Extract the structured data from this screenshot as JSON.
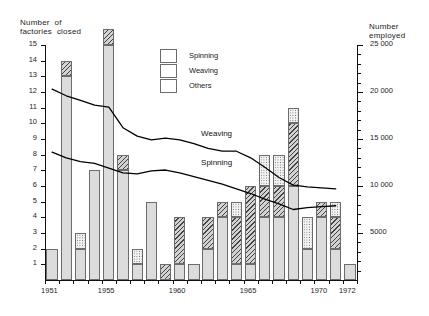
{
  "chart_data": {
    "type": "bar",
    "title": "",
    "ylabel": "Number of\nfactories closed",
    "ylabel_right": "Number\nemployed",
    "xlabel": "",
    "ylim": [
      0,
      15
    ],
    "ylim_right": [
      0,
      25000
    ],
    "grid": false,
    "legend_position": "top-center",
    "x": [
      1951,
      1952,
      1953,
      1954,
      1955,
      1956,
      1957,
      1958,
      1959,
      1960,
      1961,
      1962,
      1963,
      1964,
      1965,
      1966,
      1967,
      1968,
      1969,
      1970,
      1971,
      1972
    ],
    "x_tick_labels": [
      "1951",
      "1955",
      "1960",
      "1965",
      "1970",
      "1972"
    ],
    "x_tick_years": [
      1951,
      1955,
      1960,
      1965,
      1970,
      1972
    ],
    "y_tick_labels": [
      "1",
      "2",
      "3",
      "4",
      "5",
      "6",
      "7",
      "8",
      "9",
      "10",
      "11",
      "12",
      "13",
      "14",
      "15"
    ],
    "y_tick_values": [
      1,
      2,
      3,
      4,
      5,
      6,
      7,
      8,
      9,
      10,
      11,
      12,
      13,
      14,
      15
    ],
    "y_right_tick_labels": [
      "5000",
      "10 000",
      "15 000",
      "20 000",
      "25 000"
    ],
    "y_right_tick_values": [
      5000,
      10000,
      15000,
      20000,
      25000
    ],
    "legend": [
      {
        "key": "spinning",
        "label": "Spinning",
        "pattern": "solid-light-gray"
      },
      {
        "key": "weaving",
        "label": "Weaving",
        "pattern": "diagonal-hatch"
      },
      {
        "key": "others",
        "label": "Others",
        "pattern": "stipple-dots"
      }
    ],
    "series": [
      {
        "name": "Spinning",
        "key": "spinning",
        "values": [
          2,
          13,
          2,
          7,
          15,
          7,
          1,
          5,
          0,
          1,
          1,
          2,
          4,
          1,
          1,
          4,
          4,
          6,
          2,
          4,
          2,
          1
        ]
      },
      {
        "name": "Weaving",
        "key": "weaving",
        "values": [
          0,
          1,
          0,
          0,
          1,
          1,
          0,
          0,
          1,
          3,
          0,
          2,
          1,
          3,
          5,
          2,
          2,
          4,
          0,
          1,
          2,
          0
        ]
      },
      {
        "name": "Others",
        "key": "others",
        "values": [
          0,
          0,
          1,
          0,
          0,
          0,
          1,
          0,
          0,
          0,
          0,
          0,
          0,
          1,
          0,
          2,
          2,
          1,
          2,
          0,
          1,
          0
        ]
      }
    ],
    "bar_totals": [
      2,
      14,
      3,
      7,
      16,
      8,
      2,
      5,
      1,
      4,
      1,
      4,
      5,
      5,
      6,
      8,
      8,
      11,
      4,
      5,
      5,
      1
    ],
    "line_series": [
      {
        "name": "Weaving",
        "label": "Weaving",
        "axis": "right",
        "unit": "employed",
        "points": [
          {
            "x": 1951,
            "y": 20300
          },
          {
            "x": 1952,
            "y": 19600
          },
          {
            "x": 1953,
            "y": 19100
          },
          {
            "x": 1954,
            "y": 18600
          },
          {
            "x": 1955,
            "y": 18400
          },
          {
            "x": 1956,
            "y": 16200
          },
          {
            "x": 1957,
            "y": 15300
          },
          {
            "x": 1958,
            "y": 14900
          },
          {
            "x": 1959,
            "y": 15100
          },
          {
            "x": 1960,
            "y": 14900
          },
          {
            "x": 1961,
            "y": 14500
          },
          {
            "x": 1962,
            "y": 14000
          },
          {
            "x": 1963,
            "y": 13700
          },
          {
            "x": 1964,
            "y": 13700
          },
          {
            "x": 1965,
            "y": 13000
          },
          {
            "x": 1966,
            "y": 12000
          },
          {
            "x": 1967,
            "y": 10900
          },
          {
            "x": 1968,
            "y": 10100
          },
          {
            "x": 1969,
            "y": 9900
          },
          {
            "x": 1970,
            "y": 9800
          },
          {
            "x": 1971,
            "y": 9700
          }
        ]
      },
      {
        "name": "Spinning",
        "label": "Spinning",
        "axis": "right",
        "unit": "employed",
        "points": [
          {
            "x": 1951,
            "y": 13600
          },
          {
            "x": 1952,
            "y": 13000
          },
          {
            "x": 1953,
            "y": 12600
          },
          {
            "x": 1954,
            "y": 12400
          },
          {
            "x": 1955,
            "y": 11900
          },
          {
            "x": 1956,
            "y": 11400
          },
          {
            "x": 1957,
            "y": 11300
          },
          {
            "x": 1958,
            "y": 11600
          },
          {
            "x": 1959,
            "y": 11700
          },
          {
            "x": 1960,
            "y": 11400
          },
          {
            "x": 1961,
            "y": 11000
          },
          {
            "x": 1962,
            "y": 10600
          },
          {
            "x": 1963,
            "y": 10200
          },
          {
            "x": 1964,
            "y": 9700
          },
          {
            "x": 1965,
            "y": 9200
          },
          {
            "x": 1966,
            "y": 8600
          },
          {
            "x": 1967,
            "y": 8100
          },
          {
            "x": 1968,
            "y": 7500
          },
          {
            "x": 1969,
            "y": 7700
          },
          {
            "x": 1970,
            "y": 7800
          },
          {
            "x": 1971,
            "y": 7900
          }
        ]
      }
    ],
    "annotations": [
      {
        "name": "weaving-line-label",
        "text": "Weaving"
      },
      {
        "name": "spinning-line-label",
        "text": "Spinning"
      }
    ],
    "colors": {
      "axis": "#111111",
      "line": "#000000",
      "spinning_fill": "#dcdcdc",
      "weaving_fill": "#d2d2d2",
      "others_fill": "#f2f2f2",
      "segment_border": "#6c6c6c",
      "background": "#ffffff"
    }
  },
  "labels": {
    "y_axis_title_line1": "Number  of",
    "y_axis_title_line2": "factories  closed",
    "y_right_title_line1": "Number",
    "y_right_title_line2": "employed"
  }
}
